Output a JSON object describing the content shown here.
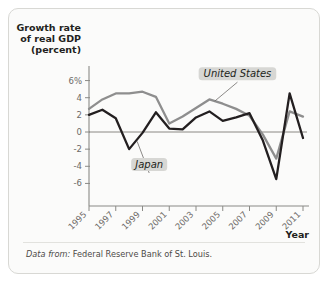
{
  "figure": {
    "source_prefix": "Data from:",
    "source_text": "Federal Reserve Bank of St. Louis.",
    "background": "#fbfbfa",
    "border_color": "#d8d8d4"
  },
  "chart_data": {
    "type": "line",
    "title": "",
    "ylabel": "Growth rate\nof real GDP\n(percent)",
    "ylabel_lines": [
      "Growth rate",
      "of real GDP",
      "(percent)"
    ],
    "xlabel": "Year",
    "x": [
      1995,
      1996,
      1997,
      1998,
      1999,
      2000,
      2001,
      2002,
      2003,
      2004,
      2005,
      2006,
      2007,
      2008,
      2009,
      2010,
      2011
    ],
    "xticks": [
      1995,
      1997,
      1999,
      2001,
      2003,
      2005,
      2007,
      2009,
      2011
    ],
    "xtick_labels": [
      "1995",
      "1997",
      "1999",
      "2001",
      "2003",
      "2005",
      "2007",
      "2009",
      "2011"
    ],
    "yticks": [
      6,
      4,
      2,
      0,
      -2,
      -4,
      -6
    ],
    "ytick_labels": [
      "6%",
      "4",
      "2",
      "0",
      "-2",
      "-4",
      "-6"
    ],
    "ylim": [
      -7,
      7
    ],
    "xlim": [
      1995,
      2011
    ],
    "grid": false,
    "zero_line": true,
    "legend_position": "inline-annotation",
    "series": [
      {
        "name": "United States",
        "color": "#8e8e8e",
        "values": [
          2.7,
          3.8,
          4.5,
          4.5,
          4.7,
          4.1,
          1.0,
          1.8,
          2.8,
          3.8,
          3.3,
          2.7,
          1.9,
          -0.3,
          -3.1,
          2.4,
          1.8
        ],
        "label_x": 2006.1,
        "label_y": 6.4,
        "anchor_x": 2004.4,
        "anchor_y": 3.6
      },
      {
        "name": "Japan",
        "color": "#231f20",
        "values": [
          2.0,
          2.6,
          1.6,
          -2.0,
          -0.1,
          2.3,
          0.4,
          0.3,
          1.7,
          2.4,
          1.3,
          1.7,
          2.2,
          -1.0,
          -5.5,
          4.5,
          -0.7
        ],
        "label_x": 1999.5,
        "label_y": -4.2,
        "anchor_x": 1998.6,
        "anchor_y": -1.1
      }
    ]
  }
}
